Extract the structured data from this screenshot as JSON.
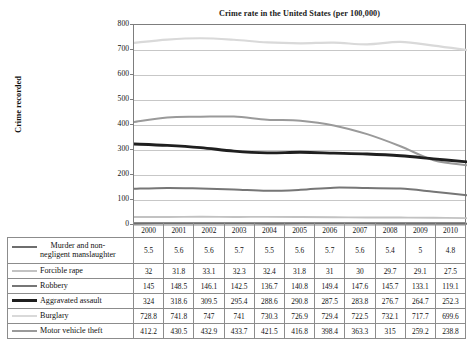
{
  "chart_data": {
    "type": "line",
    "title": "Crime rate in the United States (per 100,000)",
    "xlabel": "",
    "ylabel": "Crime recorded",
    "ylim": [
      0,
      800
    ],
    "ytick_labels": [
      "800",
      "700",
      "600",
      "500",
      "400",
      "300",
      "200",
      "100",
      "0"
    ],
    "grid": true,
    "legend_position": "table-left",
    "categories": [
      "2000",
      "2001",
      "2002",
      "2003",
      "2004",
      "2005",
      "2006",
      "2007",
      "2008",
      "2009",
      "2010"
    ],
    "series": [
      {
        "name": "Murder and non-negligent manslaughter",
        "color": "#6e6e6e",
        "values": [
          5.5,
          5.6,
          5.6,
          5.7,
          5.5,
          5.6,
          5.7,
          5.6,
          5.4,
          5,
          4.8
        ],
        "labels": [
          "5.5",
          "5.6",
          "5.6",
          "5.7",
          "5.5",
          "5.6",
          "5.7",
          "5.6",
          "5.4",
          "5",
          "4.8"
        ]
      },
      {
        "name": "Forcible rape",
        "color": "#c2c2c2",
        "values": [
          32,
          31.8,
          33.1,
          32.3,
          32.4,
          31.8,
          31,
          30,
          29.7,
          29.1,
          27.5
        ],
        "labels": [
          "32",
          "31.8",
          "33.1",
          "32.3",
          "32.4",
          "31.8",
          "31",
          "30",
          "29.7",
          "29.1",
          "27.5"
        ]
      },
      {
        "name": "Robbery",
        "color": "#767676",
        "values": [
          145,
          148.5,
          146.1,
          142.5,
          136.7,
          140.8,
          149.4,
          147.6,
          145.7,
          133.1,
          119.1
        ],
        "labels": [
          "145",
          "148.5",
          "146.1",
          "142.5",
          "136.7",
          "140.8",
          "149.4",
          "147.6",
          "145.7",
          "133.1",
          "119.1"
        ]
      },
      {
        "name": "Aggravated assault",
        "color": "#1f1f1f",
        "values": [
          324,
          318.6,
          309.5,
          295.4,
          288.6,
          290.8,
          287.5,
          283.8,
          276.7,
          264.7,
          252.3
        ],
        "labels": [
          "324",
          "318.6",
          "309.5",
          "295.4",
          "288.6",
          "290.8",
          "287.5",
          "283.8",
          "276.7",
          "264.7",
          "252.3"
        ]
      },
      {
        "name": "Burglary",
        "color": "#d9d9d9",
        "values": [
          728.8,
          741.8,
          747,
          741,
          730.3,
          726.9,
          729.4,
          722.5,
          732.1,
          717.7,
          699.6
        ],
        "labels": [
          "728.8",
          "741.8",
          "747",
          "741",
          "730.3",
          "726.9",
          "729.4",
          "722.5",
          "732.1",
          "717.7",
          "699.6"
        ]
      },
      {
        "name": "Motor vehicle theft",
        "color": "#9a9a9a",
        "values": [
          412.2,
          430.5,
          432.9,
          433.7,
          421.5,
          416.8,
          398.4,
          363.3,
          315,
          259.2,
          238.8
        ],
        "labels": [
          "412.2",
          "430.5",
          "432.9",
          "433.7",
          "421.5",
          "416.8",
          "398.4",
          "363.3",
          "315",
          "259.2",
          "238.8"
        ]
      }
    ]
  },
  "legend_rows": [
    {
      "line1": "Murder and non-",
      "line2": "negligent manslaughter"
    },
    {
      "line1": "Forcible rape",
      "line2": ""
    },
    {
      "line1": "Robbery",
      "line2": ""
    },
    {
      "line1": "Aggravated assault",
      "line2": ""
    },
    {
      "line1": "Burglary",
      "line2": ""
    },
    {
      "line1": "Motor vehicle theft",
      "line2": ""
    }
  ]
}
